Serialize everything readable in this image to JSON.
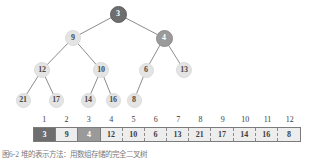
{
  "figure": {
    "caption": "图6-2 堆的表示方法：用数组存储的完全二叉树"
  },
  "tree": {
    "nodes": [
      {
        "id": "n1",
        "label": "3",
        "x": 118,
        "y": 14,
        "r": 8.5,
        "style": "dark"
      },
      {
        "id": "n2",
        "label": "9",
        "x": 73,
        "y": 38,
        "r": 8.0,
        "style": "normal"
      },
      {
        "id": "n3",
        "label": "4",
        "x": 164,
        "y": 38,
        "r": 8.5,
        "style": "mid"
      },
      {
        "id": "n4",
        "label": "12",
        "x": 42,
        "y": 70,
        "r": 8.0,
        "style": "normal"
      },
      {
        "id": "n5",
        "label": "10",
        "x": 101,
        "y": 70,
        "r": 8.0,
        "style": "normal"
      },
      {
        "id": "n6",
        "label": "6",
        "x": 146,
        "y": 70,
        "r": 7.5,
        "style": "normal"
      },
      {
        "id": "n7",
        "label": "13",
        "x": 184,
        "y": 70,
        "r": 8.0,
        "style": "normal"
      },
      {
        "id": "n8",
        "label": "21",
        "x": 23,
        "y": 100,
        "r": 7.5,
        "style": "normal"
      },
      {
        "id": "n9",
        "label": "17",
        "x": 56,
        "y": 100,
        "r": 7.5,
        "style": "normal"
      },
      {
        "id": "n10",
        "label": "14",
        "x": 88,
        "y": 100,
        "r": 7.5,
        "style": "normal"
      },
      {
        "id": "n11",
        "label": "16",
        "x": 113,
        "y": 100,
        "r": 7.5,
        "style": "normal"
      },
      {
        "id": "n12",
        "label": "8",
        "x": 134,
        "y": 100,
        "r": 7.5,
        "style": "normal"
      }
    ],
    "edges": [
      [
        "n1",
        "n2"
      ],
      [
        "n1",
        "n3"
      ],
      [
        "n2",
        "n4"
      ],
      [
        "n2",
        "n5"
      ],
      [
        "n3",
        "n6"
      ],
      [
        "n3",
        "n7"
      ],
      [
        "n4",
        "n8"
      ],
      [
        "n4",
        "n9"
      ],
      [
        "n5",
        "n10"
      ],
      [
        "n5",
        "n11"
      ],
      [
        "n6",
        "n12"
      ]
    ]
  },
  "array": {
    "indices": [
      "1",
      "2",
      "3",
      "4",
      "5",
      "6",
      "7",
      "8",
      "9",
      "10",
      "11",
      "12"
    ],
    "values": [
      "3",
      "9",
      "4",
      "12",
      "10",
      "6",
      "13",
      "21",
      "17",
      "14",
      "16",
      "8"
    ],
    "cell_styles": [
      "dark",
      "light",
      "mid",
      "light",
      "light",
      "light",
      "light",
      "light",
      "light",
      "light",
      "light",
      "light"
    ]
  },
  "colors": {
    "node_default_fill": "#e4e4e4",
    "node_highlight_dark": "#6e6e6e",
    "node_highlight_mid": "#9a9a9a",
    "array_default_fill": "#ededed",
    "array_border": "#7b7b7b",
    "edge_stroke": "#8c8c8c",
    "text": "#3d3d3d"
  }
}
